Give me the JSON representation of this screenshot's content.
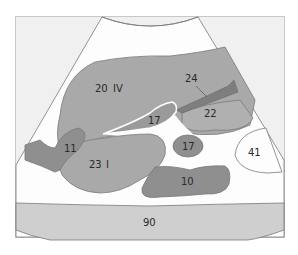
{
  "diagram": {
    "type": "ultrasound-schematic",
    "colors": {
      "background": "#ffffff",
      "frame_fill": "#f0f0f0",
      "sector_fill": "#fdfdfd",
      "light_gray": "#cfcfcf",
      "mid_gray": "#a9a9a9",
      "dark_gray": "#8f8f8f",
      "vessel": "#7e7e7e",
      "outline": "#7a7a7a"
    },
    "labels": {
      "l20": "20",
      "liv": "IV",
      "l24": "24",
      "l22": "22",
      "l17a": "17",
      "l17b": "17",
      "l11": "11",
      "l23": "23",
      "li": "I",
      "l41": "41",
      "l10": "10",
      "l90": "90"
    }
  }
}
